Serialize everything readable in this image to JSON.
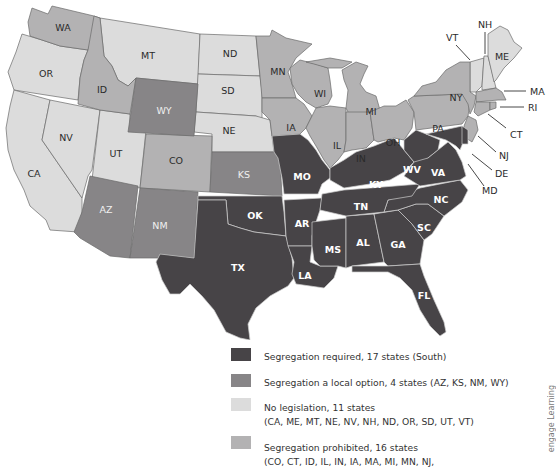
{
  "colors": {
    "required": "#474447",
    "local_option": "#878587",
    "no_legislation": "#dcdcdc",
    "prohibited": "#b3b2b3"
  },
  "legend": {
    "items": [
      {
        "key": "required",
        "line1": "Segregation required, 17 states (South)",
        "line2": ""
      },
      {
        "key": "local_option",
        "line1": "Segregation a local option, 4 states (AZ, KS, NM, WY)",
        "line2": ""
      },
      {
        "key": "no_legislation",
        "line1": "No legislation, 11 states",
        "line2": "(CA, ME, MT, NE, NV, NH, ND, OR, SD, UT, VT)"
      },
      {
        "key": "prohibited",
        "line1": "Segregation prohibited, 16 states",
        "line2": "(CO, CT, ID, IL, IN, IA, MA, MI, MN, NJ,"
      }
    ]
  },
  "credit": "engage Learning",
  "states": {
    "required": [
      "TX",
      "OK",
      "MO",
      "AR",
      "LA",
      "MS",
      "AL",
      "GA",
      "FL",
      "SC",
      "NC",
      "TN",
      "KY",
      "WV",
      "VA",
      "MD",
      "DE"
    ],
    "local_option": [
      "AZ",
      "KS",
      "NM",
      "WY"
    ],
    "no_legislation": [
      "CA",
      "ME",
      "MT",
      "NE",
      "NV",
      "NH",
      "ND",
      "OR",
      "SD",
      "UT",
      "VT"
    ],
    "prohibited": [
      "CO",
      "CT",
      "ID",
      "IL",
      "IN",
      "IA",
      "MA",
      "MI",
      "MN",
      "NJ",
      "NY",
      "OH",
      "PA",
      "RI",
      "WA",
      "WI"
    ]
  },
  "labels": {
    "WA": "WA",
    "OR": "OR",
    "CA": "CA",
    "ID": "ID",
    "NV": "NV",
    "MT": "MT",
    "WY": "WY",
    "UT": "UT",
    "AZ": "AZ",
    "CO": "CO",
    "NM": "NM",
    "ND": "ND",
    "SD": "SD",
    "NE": "NE",
    "KS": "KS",
    "OK": "OK",
    "TX": "TX",
    "MN": "MN",
    "IA": "IA",
    "MO": "MO",
    "AR": "AR",
    "LA": "LA",
    "WI": "WI",
    "IL": "IL",
    "MS": "MS",
    "MI": "MI",
    "IN": "IN",
    "OH": "OH",
    "KY": "KY",
    "TN": "TN",
    "AL": "AL",
    "GA": "GA",
    "FL": "FL",
    "SC": "SC",
    "NC": "NC",
    "VA": "VA",
    "WV": "WV",
    "PA": "PA",
    "NY": "NY",
    "ME": "ME",
    "VT": "VT",
    "NH": "NH",
    "MA": "MA",
    "RI": "RI",
    "CT": "CT",
    "NJ": "NJ",
    "DE": "DE",
    "MD": "MD"
  }
}
